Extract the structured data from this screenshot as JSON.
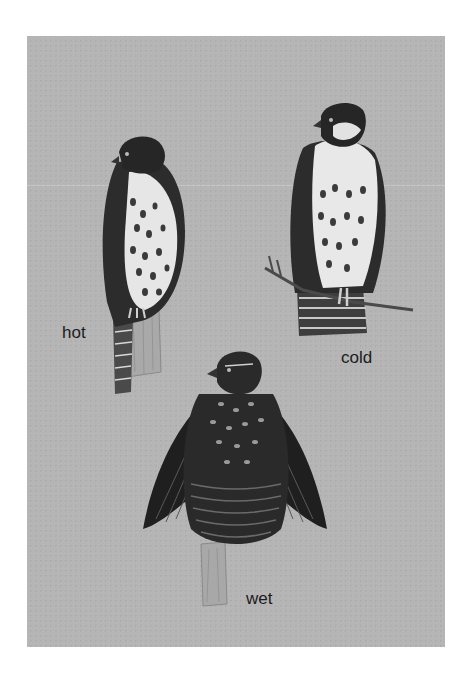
{
  "artwork": {
    "background_color": "#b5b5b5",
    "page_color": "#ffffff",
    "figures": [
      {
        "id": "hot",
        "label": "hot",
        "pose": "sleek upright hawk perched on post"
      },
      {
        "id": "cold",
        "label": "cold",
        "pose": "fluffed hawk perched on branch"
      },
      {
        "id": "wet",
        "label": "wet",
        "pose": "hawk with wings spread drooping, perched on post"
      }
    ]
  }
}
